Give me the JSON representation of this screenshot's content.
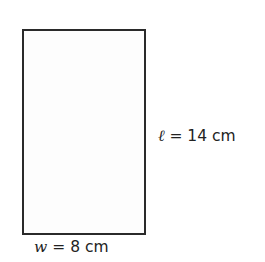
{
  "diagram": {
    "shape": "rectangle",
    "length_label": {
      "variable": "ℓ",
      "equals": " = ",
      "value": "14 cm"
    },
    "width_label": {
      "variable": "w",
      "equals": " = ",
      "value": "8 cm"
    }
  }
}
